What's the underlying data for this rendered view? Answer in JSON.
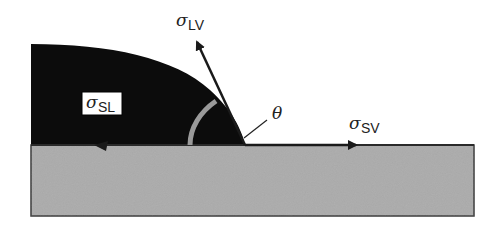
{
  "diagram": {
    "colors": {
      "droplet": "#0c0c0c",
      "substrate": "#ababab",
      "substrate_edge": "#3a3a3a",
      "angle_arc": "#9a9a9a",
      "vectors": "#1a1a1a",
      "background": "#ffffff"
    },
    "labels": {
      "sigma_lv": {
        "symbol": "σ",
        "subscript": "LV",
        "meaning": "liquid-vapor surface tension"
      },
      "sigma_sl": {
        "symbol": "σ",
        "subscript": "SL",
        "meaning": "solid-liquid interfacial tension"
      },
      "sigma_sv": {
        "symbol": "σ",
        "subscript": "SV",
        "meaning": "solid-vapor surface tension"
      },
      "theta": {
        "symbol": "θ",
        "meaning": "contact angle"
      }
    },
    "components": [
      "droplet",
      "substrate",
      "sigma_lv_arrow",
      "sigma_sv_arrow",
      "sigma_sl_arrow",
      "contact_angle_arc"
    ]
  }
}
